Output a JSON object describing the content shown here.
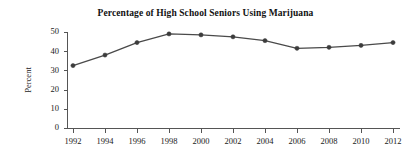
{
  "chart_data": {
    "type": "line",
    "title": "Percentage of High School Seniors Using Marijuana",
    "xlabel": "",
    "ylabel": "Percent",
    "x": [
      1992,
      1994,
      1996,
      1998,
      2000,
      2002,
      2004,
      2006,
      2008,
      2010,
      2012
    ],
    "values": [
      32.5,
      38.0,
      44.5,
      49.0,
      48.5,
      47.5,
      45.5,
      41.5,
      42.0,
      43.0,
      44.5
    ],
    "series": [
      {
        "name": "Percent of high school seniors using marijuana",
        "values": [
          32.5,
          38.0,
          44.5,
          49.0,
          48.5,
          47.5,
          45.5,
          41.5,
          42.0,
          43.0,
          44.5
        ]
      }
    ],
    "xtick_labels": [
      "1992",
      "1994",
      "1996",
      "1998",
      "2000",
      "2002",
      "2004",
      "2006",
      "2008",
      "2010",
      "2012"
    ],
    "ytick_labels": [
      "0",
      "10",
      "20",
      "30",
      "40",
      "50"
    ],
    "ytick_values": [
      0,
      10,
      20,
      30,
      40,
      50
    ],
    "xlim": [
      1991,
      2013
    ],
    "ylim": [
      0,
      50
    ],
    "grid": false,
    "legend": null,
    "legend_position": "none",
    "line_color": "#4a4a4a",
    "marker_color": "#3c3c3c",
    "axis_color": "#555555",
    "background_color": "#ffffff",
    "marker": "circle"
  }
}
